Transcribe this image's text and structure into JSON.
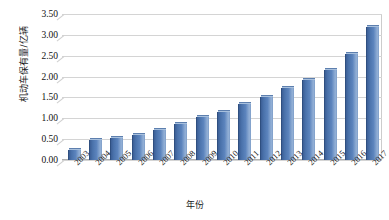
{
  "chart_data": {
    "type": "bar",
    "title": "",
    "subtitle": "",
    "xlabel": "年份",
    "ylabel": "机动车保有量/亿辆",
    "categories": [
      "2003",
      "2004",
      "2005",
      "2006",
      "2007",
      "2008",
      "2009",
      "2010",
      "2011",
      "2012",
      "2013",
      "2014",
      "2015",
      "2016",
      "2017"
    ],
    "values": [
      0.24,
      0.47,
      0.53,
      0.6,
      0.72,
      0.86,
      1.02,
      1.15,
      1.35,
      1.52,
      1.73,
      1.93,
      2.15,
      2.53,
      3.2
    ],
    "series": [
      {
        "name": "机动车保有量",
        "values": [
          0.24,
          0.47,
          0.53,
          0.6,
          0.72,
          0.86,
          1.02,
          1.15,
          1.35,
          1.52,
          1.73,
          1.93,
          2.15,
          2.53,
          3.2
        ]
      }
    ],
    "ylim": [
      0.0,
      3.5
    ],
    "ytick_labels": [
      "0.00",
      "0.50",
      "1.00",
      "1.50",
      "2.00",
      "2.50",
      "3.00",
      "3.50"
    ],
    "ytick_values": [
      0.0,
      0.5,
      1.0,
      1.5,
      2.0,
      2.5,
      3.0,
      3.5
    ],
    "grid": true,
    "legend": false,
    "legend_position": "none",
    "bar_color": "#4a72ab",
    "grid_color": "#d4d4d4",
    "background_color": "#ffffff",
    "annotations": []
  }
}
